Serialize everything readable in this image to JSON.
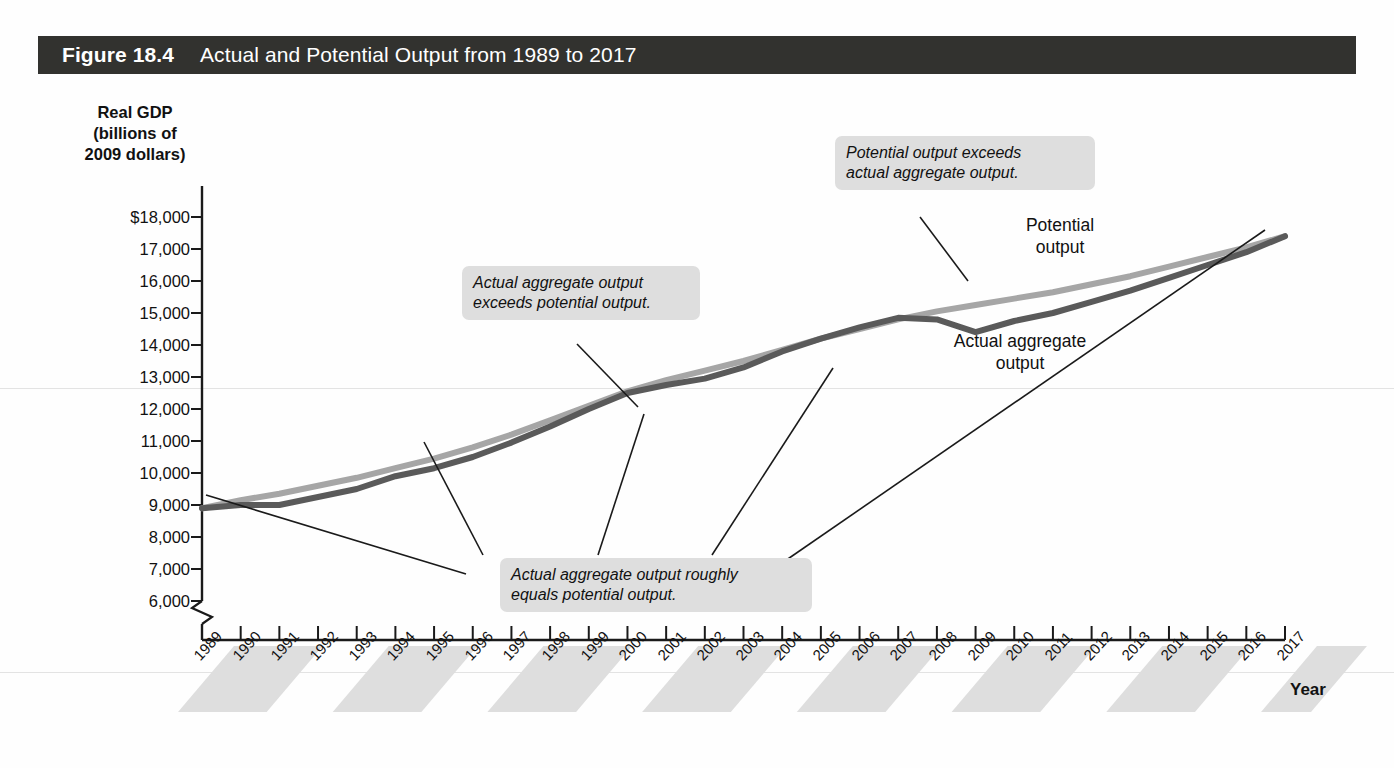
{
  "figure": {
    "number": "Figure 18.4",
    "title": "Actual and Potential Output from 1989 to 2017"
  },
  "axes": {
    "y_title": "Real GDP\n(billions of\n2009 dollars)",
    "y_title_line1": "Real GDP",
    "y_title_line2": "(billions of",
    "y_title_line3": "2009 dollars)",
    "x_title": "Year",
    "y_ticks": [
      "$18,000",
      "17,000",
      "16,000",
      "15,000",
      "14,000",
      "13,000",
      "12,000",
      "11,000",
      "10,000",
      "9,000",
      "8,000",
      "7,000",
      "6,000"
    ],
    "axis_break": true
  },
  "callouts": [
    {
      "name": "potential-exceeds-actual",
      "line1": "Potential output exceeds",
      "line2": "actual aggregate output."
    },
    {
      "name": "actual-exceeds-potential",
      "line1": "Actual aggregate output",
      "line2": "exceeds potential output."
    },
    {
      "name": "actual-equals-potential",
      "line1": "Actual aggregate output roughly",
      "line2": "equals potential output."
    }
  ],
  "series_labels": {
    "potential_line1": "Potential",
    "potential_line2": "output",
    "actual_line1": "Actual aggregate",
    "actual_line2": "output"
  },
  "colors": {
    "title_bar": "#32322f",
    "potential_output": "#a6a6a6",
    "actual_output": "#5a5a5a",
    "callout_bg": "#dedede",
    "year_band": "#dedede"
  },
  "chart_data": {
    "type": "line",
    "title": "Actual and Potential Output from 1989 to 2017",
    "xlabel": "Year",
    "ylabel": "Real GDP (billions of 2009 dollars)",
    "ylim": [
      6000,
      18000
    ],
    "ytick_step": 1000,
    "grid": false,
    "axis_break_y": true,
    "legend": "inline-labels",
    "x": [
      1989,
      1990,
      1991,
      1992,
      1993,
      1994,
      1995,
      1996,
      1997,
      1998,
      1999,
      2000,
      2001,
      2002,
      2003,
      2004,
      2005,
      2006,
      2007,
      2008,
      2009,
      2010,
      2011,
      2012,
      2013,
      2014,
      2015,
      2016,
      2017
    ],
    "categories": [
      "1989",
      "1990",
      "1991",
      "1992",
      "1993",
      "1994",
      "1995",
      "1996",
      "1997",
      "1998",
      "1999",
      "2000",
      "2001",
      "2002",
      "2003",
      "2004",
      "2005",
      "2006",
      "2007",
      "2008",
      "2009",
      "2010",
      "2011",
      "2012",
      "2013",
      "2014",
      "2015",
      "2016",
      "2017"
    ],
    "series": [
      {
        "name": "Potential output",
        "color": "#a6a6a6",
        "values": [
          8900,
          9150,
          9350,
          9600,
          9850,
          10150,
          10450,
          10800,
          11200,
          11650,
          12100,
          12550,
          12900,
          13200,
          13500,
          13850,
          14200,
          14500,
          14800,
          15050,
          15250,
          15450,
          15650,
          15900,
          16150,
          16450,
          16750,
          17050,
          17400
        ]
      },
      {
        "name": "Actual aggregate output",
        "color": "#5a5a5a",
        "values": [
          8900,
          9000,
          9000,
          9250,
          9500,
          9900,
          10150,
          10500,
          10950,
          11450,
          12000,
          12500,
          12750,
          12950,
          13300,
          13800,
          14200,
          14550,
          14850,
          14800,
          14400,
          14750,
          15000,
          15350,
          15700,
          16100,
          16500,
          16900,
          17400
        ]
      }
    ],
    "annotations": [
      {
        "text": "Potential output exceeds actual aggregate output.",
        "points_to_year": 2008
      },
      {
        "text": "Actual aggregate output exceeds potential output.",
        "points_to_year": 2000
      },
      {
        "text": "Actual aggregate output roughly equals potential output.",
        "points_to_years": [
          1989,
          1997,
          2001,
          2005,
          2017
        ]
      }
    ]
  }
}
